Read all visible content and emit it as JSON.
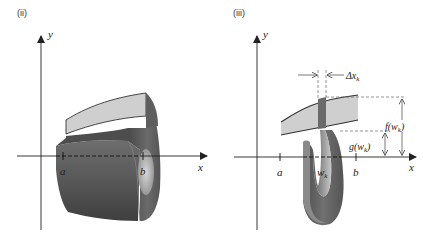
{
  "panels": [
    {
      "id": "ii",
      "label": "(ii)",
      "axes": {
        "x_label": "x",
        "y_label": "y"
      },
      "ticks": {
        "a": "a",
        "b": "b"
      },
      "description": "Solid of revolution (washer) formed by rotating region between f and g about the x-axis"
    },
    {
      "id": "iii",
      "label": "(iii)",
      "axes": {
        "x_label": "x",
        "y_label": "y"
      },
      "ticks": {
        "a": "a",
        "w": "w",
        "w_sub": "k",
        "b": "b"
      },
      "annotations": {
        "delta": "Δx",
        "delta_sub": "k",
        "f_label": "f(w",
        "f_sub": "k",
        "f_close": ")",
        "g_label": "g(w",
        "g_sub": "k",
        "g_close": ")"
      },
      "description": "Representative rectangle of width Δx_k rotated into a washer"
    }
  ],
  "colors": {
    "region_fill": "#cfcfcf",
    "solid_dark": "#555555",
    "solid_mid": "#7a7a7a",
    "solid_light": "#bdbdbd",
    "strip": "#6a6a6a",
    "axis": "#222222"
  }
}
